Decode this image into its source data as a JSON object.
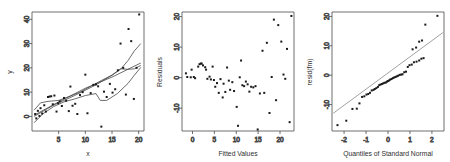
{
  "figure": {
    "title": "",
    "panel_count": 3
  },
  "chart_data": [
    {
      "type": "scatter",
      "panel": 1,
      "title": "",
      "xlabel": "x",
      "ylabel": "y",
      "xlim": [
        0,
        21
      ],
      "ylim": [
        -6,
        43
      ],
      "xticks": [
        5,
        10,
        15,
        20
      ],
      "yticks": [
        0,
        10,
        20,
        30,
        40
      ],
      "grid": false,
      "legend": "none",
      "points": [
        [
          0.6,
          1.0
        ],
        [
          0.8,
          -0.8
        ],
        [
          1.1,
          2.3
        ],
        [
          1.4,
          0.2
        ],
        [
          1.6,
          3.4
        ],
        [
          1.9,
          1.2
        ],
        [
          2.3,
          4.6
        ],
        [
          2.6,
          2.0
        ],
        [
          3.0,
          8.0
        ],
        [
          3.3,
          8.2
        ],
        [
          3.6,
          8.3
        ],
        [
          3.9,
          5.0
        ],
        [
          4.2,
          8.6
        ],
        [
          4.6,
          2.0
        ],
        [
          4.9,
          5.4
        ],
        [
          5.2,
          6.2
        ],
        [
          5.6,
          4.3
        ],
        [
          6.0,
          7.6
        ],
        [
          6.4,
          6.5
        ],
        [
          6.9,
          2.2
        ],
        [
          7.2,
          12.3
        ],
        [
          7.6,
          4.4
        ],
        [
          8.1,
          5.2
        ],
        [
          8.5,
          1.0
        ],
        [
          9.0,
          8.8
        ],
        [
          9.5,
          10.0
        ],
        [
          10.0,
          17.2
        ],
        [
          10.4,
          1.3
        ],
        [
          11.0,
          9.6
        ],
        [
          11.5,
          13.0
        ],
        [
          12.0,
          13.2
        ],
        [
          12.4,
          12.4
        ],
        [
          13.0,
          -4.2
        ],
        [
          13.5,
          10.2
        ],
        [
          14.0,
          8.0
        ],
        [
          14.6,
          13.4
        ],
        [
          15.1,
          9.8
        ],
        [
          15.6,
          11.2
        ],
        [
          16.1,
          19.0
        ],
        [
          16.6,
          30.0
        ],
        [
          17.1,
          20.0
        ],
        [
          17.6,
          9.0
        ],
        [
          18.1,
          36.0
        ],
        [
          18.6,
          31.0
        ],
        [
          19.1,
          7.2
        ],
        [
          19.6,
          20.0
        ],
        [
          20.1,
          42.0
        ]
      ],
      "fitted_curves": [
        {
          "name": "linear-fit",
          "points": [
            [
              0.4,
              0.5
            ],
            [
              5.0,
              6.0
            ],
            [
              10.0,
              11.6
            ],
            [
              15.0,
              16.2
            ],
            [
              20.4,
              22.0
            ]
          ]
        },
        {
          "name": "lowess-fit",
          "points": [
            [
              0.4,
              -2.6
            ],
            [
              2.0,
              1.0
            ],
            [
              4.0,
              4.0
            ],
            [
              6.0,
              6.0
            ],
            [
              8.0,
              7.2
            ],
            [
              10.0,
              8.6
            ],
            [
              12.0,
              9.4
            ],
            [
              12.8,
              6.6
            ],
            [
              14.0,
              6.6
            ],
            [
              16.0,
              9.4
            ],
            [
              18.0,
              13.6
            ],
            [
              19.2,
              17.0
            ],
            [
              20.4,
              20.2
            ]
          ]
        },
        {
          "name": "spline-fit",
          "points": [
            [
              0.4,
              2.6
            ],
            [
              1.6,
              5.6
            ],
            [
              3.0,
              6.2
            ],
            [
              5.0,
              6.6
            ],
            [
              7.0,
              8.2
            ],
            [
              9.0,
              10.0
            ],
            [
              11.0,
              12.4
            ],
            [
              13.0,
              14.8
            ],
            [
              15.0,
              17.0
            ],
            [
              16.6,
              19.4
            ],
            [
              18.0,
              23.0
            ],
            [
              19.2,
              27.0
            ],
            [
              20.4,
              30.0
            ]
          ]
        },
        {
          "name": "poly-fit",
          "points": [
            [
              0.4,
              0.0
            ],
            [
              4.0,
              4.6
            ],
            [
              8.0,
              8.6
            ],
            [
              12.0,
              13.0
            ],
            [
              15.0,
              17.0
            ],
            [
              16.6,
              19.6
            ],
            [
              18.0,
              19.4
            ],
            [
              19.2,
              19.6
            ],
            [
              20.4,
              21.0
            ]
          ]
        }
      ]
    },
    {
      "type": "scatter",
      "panel": 2,
      "title": "",
      "xlabel": "Fitted Values",
      "ylabel": "Residuals",
      "xlim": [
        -2.4,
        23.2
      ],
      "ylim": [
        -17.5,
        21.5
      ],
      "xticks": [
        0,
        5,
        10,
        15,
        20
      ],
      "yticks": [
        -10,
        0,
        10,
        20
      ],
      "grid": false,
      "legend": "none",
      "points": [
        [
          -1.5,
          1.4
        ],
        [
          -1.2,
          0.2
        ],
        [
          -0.4,
          0.1
        ],
        [
          -0.2,
          2.6
        ],
        [
          0.3,
          0.2
        ],
        [
          0.6,
          -0.2
        ],
        [
          1.3,
          3.6
        ],
        [
          1.6,
          4.4
        ],
        [
          1.9,
          4.6
        ],
        [
          2.1,
          4.6
        ],
        [
          2.4,
          4.0
        ],
        [
          2.9,
          3.4
        ],
        [
          3.1,
          2.6
        ],
        [
          3.4,
          -0.4
        ],
        [
          3.9,
          0.3
        ],
        [
          4.2,
          -0.6
        ],
        [
          4.6,
          3.6
        ],
        [
          4.9,
          -0.8
        ],
        [
          5.2,
          -3.0
        ],
        [
          5.6,
          -1.8
        ],
        [
          6.0,
          -5.0
        ],
        [
          6.4,
          -0.5
        ],
        [
          6.9,
          -6.5
        ],
        [
          7.1,
          -2.0
        ],
        [
          7.5,
          -4.7
        ],
        [
          7.9,
          3.3
        ],
        [
          8.3,
          -1.0
        ],
        [
          8.6,
          -4.0
        ],
        [
          9.1,
          -1.5
        ],
        [
          9.5,
          -4.4
        ],
        [
          10.1,
          -9.6
        ],
        [
          10.4,
          -15.8
        ],
        [
          10.8,
          0.1
        ],
        [
          11.1,
          5.6
        ],
        [
          11.4,
          -2.5
        ],
        [
          11.8,
          -2.8
        ],
        [
          12.2,
          -1.3
        ],
        [
          12.6,
          -2.2
        ],
        [
          13.0,
          -4.6
        ],
        [
          13.4,
          -3.0
        ],
        [
          13.9,
          -3.2
        ],
        [
          14.4,
          -2.8
        ],
        [
          14.9,
          -17.0
        ],
        [
          15.4,
          -5.2
        ],
        [
          16.0,
          8.8
        ],
        [
          16.4,
          -5.0
        ],
        [
          17.0,
          11.4
        ],
        [
          17.6,
          -11.6
        ],
        [
          18.1,
          0.2
        ],
        [
          18.6,
          19.0
        ],
        [
          19.1,
          -7.4
        ],
        [
          19.6,
          17.2
        ],
        [
          20.3,
          11.8
        ],
        [
          20.8,
          1.0
        ],
        [
          21.2,
          -0.4
        ],
        [
          21.6,
          9.4
        ],
        [
          22.2,
          -14.6
        ],
        [
          22.6,
          20.2
        ]
      ]
    },
    {
      "type": "scatter",
      "panel": 3,
      "title": "",
      "xlabel": "Quantiles of Standard Normal",
      "ylabel": "resid(fm)",
      "xlim": [
        -2.55,
        2.55
      ],
      "ylim": [
        -19,
        21.5
      ],
      "xticks": [
        -2,
        -1,
        0,
        1,
        2
      ],
      "yticks": [
        -10,
        0,
        10,
        20
      ],
      "grid": false,
      "legend": "none",
      "reference_line": {
        "name": "qq-reference-line",
        "points": [
          [
            -2.5,
            -13.0
          ],
          [
            2.5,
            14.5
          ]
        ]
      },
      "points": [
        [
          -2.3,
          -17.0
        ],
        [
          -1.9,
          -15.5
        ],
        [
          -1.62,
          -11.5
        ],
        [
          -1.42,
          -11.4
        ],
        [
          -1.3,
          -9.6
        ],
        [
          -1.18,
          -7.4
        ],
        [
          -1.08,
          -7.2
        ],
        [
          -0.98,
          -6.6
        ],
        [
          -0.9,
          -6.4
        ],
        [
          -0.82,
          -6.0
        ],
        [
          -0.74,
          -5.2
        ],
        [
          -0.66,
          -5.0
        ],
        [
          -0.6,
          -4.7
        ],
        [
          -0.53,
          -4.4
        ],
        [
          -0.46,
          -4.0
        ],
        [
          -0.4,
          -3.4
        ],
        [
          -0.34,
          -3.2
        ],
        [
          -0.28,
          -3.0
        ],
        [
          -0.22,
          -2.8
        ],
        [
          -0.16,
          -2.6
        ],
        [
          -0.1,
          -2.5
        ],
        [
          -0.05,
          -2.2
        ],
        [
          0.0,
          -2.0
        ],
        [
          0.05,
          -1.8
        ],
        [
          0.1,
          -1.5
        ],
        [
          0.16,
          -1.3
        ],
        [
          0.22,
          -1.0
        ],
        [
          0.28,
          -0.8
        ],
        [
          0.34,
          -0.6
        ],
        [
          0.4,
          -0.4
        ],
        [
          0.46,
          -0.2
        ],
        [
          0.53,
          0.1
        ],
        [
          0.6,
          0.2
        ],
        [
          0.66,
          0.3
        ],
        [
          0.74,
          1.0
        ],
        [
          0.82,
          1.2
        ],
        [
          0.9,
          2.8
        ],
        [
          0.98,
          3.4
        ],
        [
          1.08,
          3.6
        ],
        [
          1.18,
          4.4
        ],
        [
          1.3,
          4.6
        ],
        [
          1.42,
          5.0
        ],
        [
          1.52,
          5.6
        ],
        [
          1.62,
          5.8
        ],
        [
          1.12,
          8.8
        ],
        [
          1.28,
          9.4
        ],
        [
          1.42,
          11.4
        ],
        [
          1.55,
          11.8
        ],
        [
          1.7,
          17.2
        ],
        [
          2.25,
          20.2
        ]
      ]
    }
  ]
}
